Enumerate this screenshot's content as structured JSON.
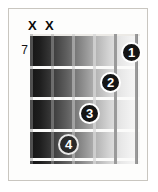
{
  "diagram": {
    "type": "guitar-chord-diagram",
    "starting_fret_label": "7",
    "string_count": 6,
    "fret_count": 4,
    "mute_markers": [
      {
        "label": "X",
        "string_index": 0
      },
      {
        "label": "X",
        "string_index": 1
      }
    ],
    "finger_positions": [
      {
        "label": "1",
        "string_index": 5,
        "fret_index": 0,
        "left": 121,
        "top": 42,
        "on_dark": false
      },
      {
        "label": "2",
        "string_index": 4,
        "fret_index": 1,
        "left": 100,
        "top": 72,
        "on_dark": false
      },
      {
        "label": "3",
        "string_index": 3,
        "fret_index": 2,
        "left": 79,
        "top": 103,
        "on_dark": false
      },
      {
        "label": "4",
        "string_index": 2,
        "fret_index": 3,
        "left": 58,
        "top": 134,
        "on_dark": true
      }
    ],
    "fret_lines": [
      {
        "top": 0,
        "nut": true
      },
      {
        "top": 32,
        "nut": false
      },
      {
        "top": 63,
        "nut": false
      },
      {
        "top": 95,
        "nut": false
      },
      {
        "top": 124,
        "nut": false
      }
    ],
    "strings": [
      {
        "left": 0
      },
      {
        "left": 21
      },
      {
        "left": 42
      },
      {
        "left": 63
      },
      {
        "left": 84
      },
      {
        "left": 105
      }
    ],
    "colors": {
      "page_background": "#ffffff",
      "card_background": "#fdfdfc",
      "card_border": "#c9c6c0",
      "fret_wire": "#fbfbfa",
      "dot_fill": "#151515",
      "dot_text": "#ffffff",
      "mute_mark": "#0a0a0a",
      "fret_number": "#141414",
      "board_dark": "#141414",
      "board_light": "#f7f7f6"
    }
  }
}
